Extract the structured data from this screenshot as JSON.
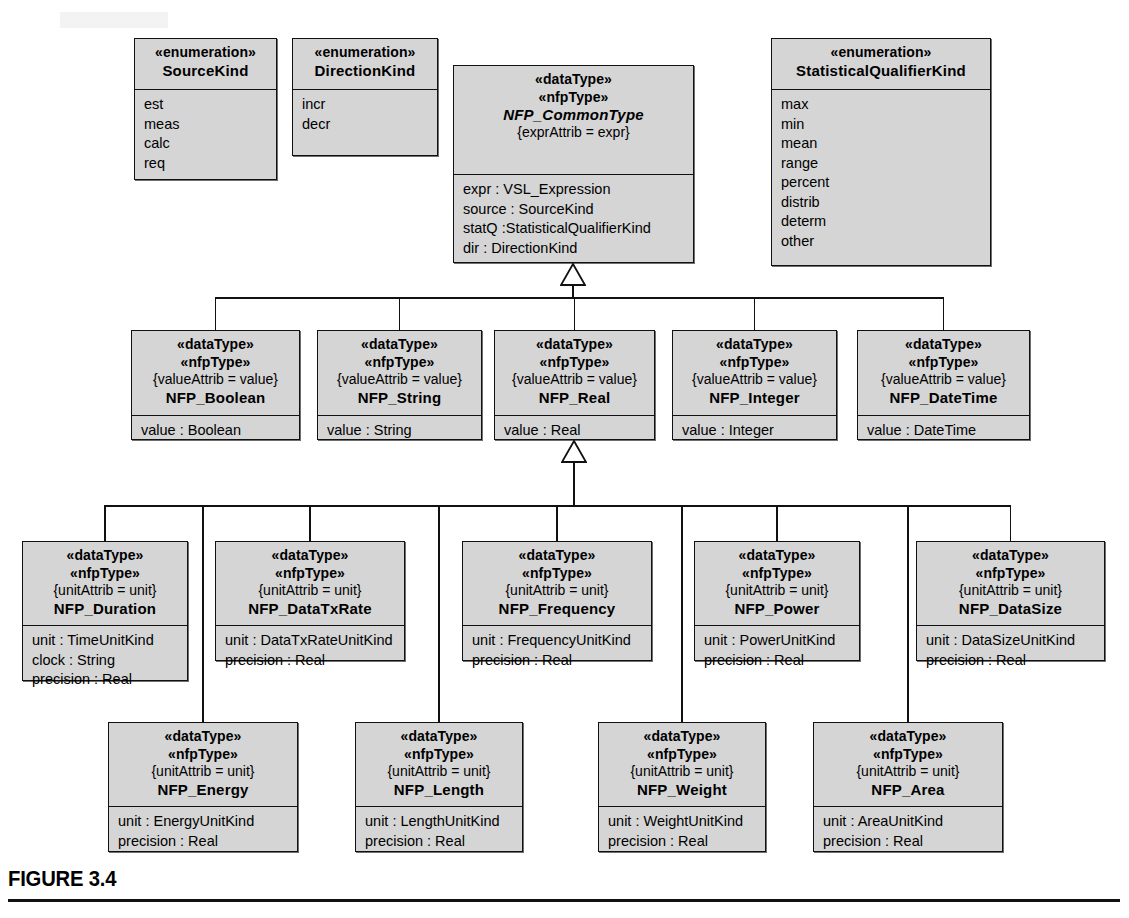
{
  "figure": {
    "caption": "FIGURE 3.4"
  },
  "stereotypes": {
    "enumeration": "«enumeration»",
    "dataType": "«dataType»",
    "nfpType": "«nfpType»"
  },
  "constraints": {
    "expr": "{exprAttrib = expr}",
    "value": "{valueAttrib = value}",
    "unit": "{unitAttrib = unit}"
  },
  "colors": {
    "fill": "#d5d5d5",
    "stroke": "#111111",
    "page": "#ffffff"
  },
  "enumerations": [
    {
      "name": "SourceKind",
      "literals": [
        "est",
        "meas",
        "calc",
        "req"
      ]
    },
    {
      "name": "DirectionKind",
      "literals": [
        "incr",
        "decr"
      ]
    },
    {
      "name": "StatisticalQualifierKind",
      "literals": [
        "max",
        "min",
        "mean",
        "range",
        "percent",
        "distrib",
        "determ",
        "other"
      ]
    }
  ],
  "root": {
    "name": "NFP_CommonType",
    "constraint": "{exprAttrib = expr}",
    "attributes": [
      "expr : VSL_Expression",
      "source : SourceKind",
      "statQ :StatisticalQualifierKind",
      "dir : DirectionKind"
    ]
  },
  "level2": [
    {
      "name": "NFP_Boolean",
      "constraint": "{valueAttrib = value}",
      "attributes": [
        "value : Boolean"
      ]
    },
    {
      "name": "NFP_String",
      "constraint": "{valueAttrib = value}",
      "attributes": [
        "value : String"
      ]
    },
    {
      "name": "NFP_Real",
      "constraint": "{valueAttrib = value}",
      "attributes": [
        "value : Real"
      ]
    },
    {
      "name": "NFP_Integer",
      "constraint": "{valueAttrib = value}",
      "attributes": [
        "value : Integer"
      ]
    },
    {
      "name": "NFP_DateTime",
      "constraint": "{valueAttrib = value}",
      "attributes": [
        "value : DateTime"
      ]
    }
  ],
  "level3": [
    {
      "name": "NFP_Duration",
      "constraint": "{unitAttrib = unit}",
      "attributes": [
        "unit : TimeUnitKind",
        "clock : String",
        "precision : Real"
      ]
    },
    {
      "name": "NFP_DataTxRate",
      "constraint": "{unitAttrib = unit}",
      "attributes": [
        "unit : DataTxRateUnitKind",
        "precision : Real"
      ]
    },
    {
      "name": "NFP_Frequency",
      "constraint": "{unitAttrib = unit}",
      "attributes": [
        "unit : FrequencyUnitKind",
        "precision : Real"
      ]
    },
    {
      "name": "NFP_Power",
      "constraint": "{unitAttrib = unit}",
      "attributes": [
        "unit : PowerUnitKind",
        "precision : Real"
      ]
    },
    {
      "name": "NFP_DataSize",
      "constraint": "{unitAttrib = unit}",
      "attributes": [
        "unit : DataSizeUnitKind",
        "precision : Real"
      ]
    }
  ],
  "level4": [
    {
      "name": "NFP_Energy",
      "constraint": "{unitAttrib = unit}",
      "attributes": [
        "unit : EnergyUnitKind",
        "precision : Real"
      ]
    },
    {
      "name": "NFP_Length",
      "constraint": "{unitAttrib = unit}",
      "attributes": [
        "unit : LengthUnitKind",
        "precision : Real"
      ]
    },
    {
      "name": "NFP_Weight",
      "constraint": "{unitAttrib = unit}",
      "attributes": [
        "unit : WeightUnitKind",
        "precision : Real"
      ]
    },
    {
      "name": "NFP_Area",
      "constraint": "{unitAttrib = unit}",
      "attributes": [
        "unit : AreaUnitKind",
        "precision : Real"
      ]
    }
  ],
  "layout": {
    "enum_boxes": [
      {
        "x": 134,
        "y": 38,
        "w": 143,
        "h": 142,
        "head_h": 50
      },
      {
        "x": 292,
        "y": 38,
        "w": 146,
        "h": 118,
        "head_h": 50
      },
      {
        "x": 771,
        "y": 38,
        "w": 220,
        "h": 228,
        "head_h": 50
      }
    ],
    "root_box": {
      "x": 453,
      "y": 65,
      "w": 241,
      "h": 198,
      "head_h": 108
    },
    "row2": {
      "y": 330,
      "h": 110,
      "head_h": 84,
      "boxes": [
        {
          "x": 131,
          "w": 169
        },
        {
          "x": 317,
          "w": 165
        },
        {
          "x": 494,
          "w": 161
        },
        {
          "x": 672,
          "w": 165
        },
        {
          "x": 857,
          "w": 173
        }
      ]
    },
    "row3": {
      "y": 541,
      "h": 140,
      "head_h": 83,
      "boxes": [
        {
          "x": 22,
          "w": 166,
          "h": 140
        },
        {
          "x": 215,
          "w": 190,
          "h": 120
        },
        {
          "x": 462,
          "w": 190,
          "h": 120
        },
        {
          "x": 694,
          "w": 166,
          "h": 120
        },
        {
          "x": 916,
          "w": 189,
          "h": 120
        }
      ]
    },
    "row4": {
      "y": 722,
      "h": 130,
      "head_h": 83,
      "boxes": [
        {
          "x": 108,
          "w": 190
        },
        {
          "x": 355,
          "w": 168
        },
        {
          "x": 598,
          "w": 168
        },
        {
          "x": 813,
          "w": 190
        }
      ]
    },
    "bus2_y": 297,
    "bus3_y": 505,
    "tri1": {
      "cx": 573,
      "y": 263
    },
    "tri2": {
      "cx": 574,
      "y": 440
    }
  }
}
